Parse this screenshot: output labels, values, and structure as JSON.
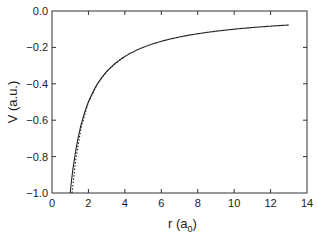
{
  "chart_data": {
    "type": "line",
    "title": "",
    "xlabel": "r  (a0)",
    "xlabel_main": "r  (a",
    "xlabel_sub": "0",
    "xlabel_close": ")",
    "ylabel": "V  (a.u.)",
    "xlim": [
      0,
      14
    ],
    "ylim": [
      -1.0,
      0.0
    ],
    "xticks": [
      0,
      2,
      4,
      6,
      8,
      10,
      12,
      14
    ],
    "xtick_labels": [
      "0",
      "2",
      "4",
      "6",
      "8",
      "10",
      "12",
      "14"
    ],
    "yticks": [
      0.0,
      -0.2,
      -0.4,
      -0.6,
      -0.8,
      -1.0
    ],
    "ytick_labels": [
      "0.0",
      "−0.2",
      "−0.4",
      "−0.6",
      "−0.8",
      "−1.0"
    ],
    "grid": false,
    "legend": null,
    "series": [
      {
        "name": "solid",
        "style": "solid",
        "x": [
          1.0,
          1.2,
          1.5,
          2.0,
          2.5,
          3.0,
          4.0,
          5.0,
          6.0,
          7.0,
          8.0,
          9.0,
          10.0,
          11.0,
          12.0,
          13.0
        ],
        "values": [
          -1.0,
          -0.833,
          -0.667,
          -0.5,
          -0.4,
          -0.333,
          -0.25,
          -0.2,
          -0.167,
          -0.143,
          -0.125,
          -0.111,
          -0.1,
          -0.091,
          -0.083,
          -0.077
        ]
      },
      {
        "name": "dotted",
        "style": "dotted",
        "x": [
          1.1,
          1.3,
          1.6,
          2.0,
          2.5,
          3.0,
          3.5,
          4.0
        ],
        "values": [
          -1.0,
          -0.82,
          -0.64,
          -0.5,
          -0.4,
          -0.333,
          -0.286,
          -0.25
        ]
      }
    ]
  }
}
